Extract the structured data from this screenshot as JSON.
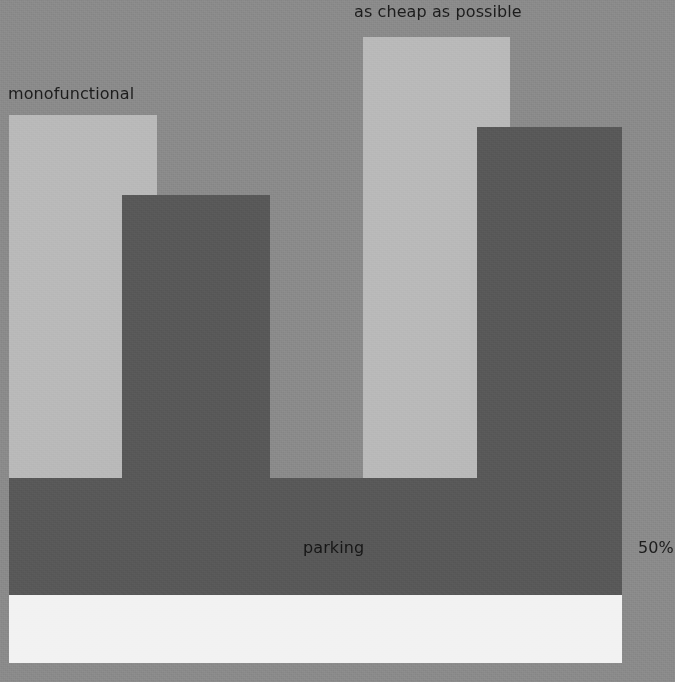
{
  "figure": {
    "background_color": "#8a8a8a",
    "light_bar_color": "#b9b9b9",
    "dark_bar_color": "#585858",
    "white_band_color": "#f2f2f2",
    "label_color": "#1c1c1c"
  },
  "labels": {
    "monofunctional": "monofunctional",
    "as_cheap_as_possible": "as cheap as possible",
    "parking": "parking",
    "percent": "50%"
  },
  "chart_data": {
    "type": "bar",
    "title": "",
    "subtitle": "",
    "xlabel": "",
    "ylabel": "",
    "grid": false,
    "legend": "none",
    "annotations": [
      {
        "text": "monofunctional",
        "target": "bar-1",
        "position": "above-left"
      },
      {
        "text": "as cheap as possible",
        "target": "bar-3",
        "position": "above"
      },
      {
        "text": "parking",
        "target": "base-band-dark",
        "position": "inside-center"
      },
      {
        "text": "50%",
        "target": "base-band-dark",
        "position": "right-outside",
        "clipped": true
      }
    ],
    "categories": [
      "bar-1",
      "bar-2",
      "bar-3",
      "bar-4"
    ],
    "series": [
      {
        "name": "overlapping blocks",
        "values": [
          363,
          283,
          441,
          351
        ],
        "unit": "px-height",
        "colors": [
          "#b9b9b9",
          "#585858",
          "#b9b9b9",
          "#585858"
        ]
      }
    ],
    "bands": [
      {
        "name": "parking",
        "color": "#585858",
        "height": 117,
        "label": "parking",
        "right_label": "50%"
      },
      {
        "name": "base",
        "color": "#f2f2f2",
        "height": 68,
        "label": ""
      }
    ],
    "ylim": [
      0,
      682
    ]
  }
}
